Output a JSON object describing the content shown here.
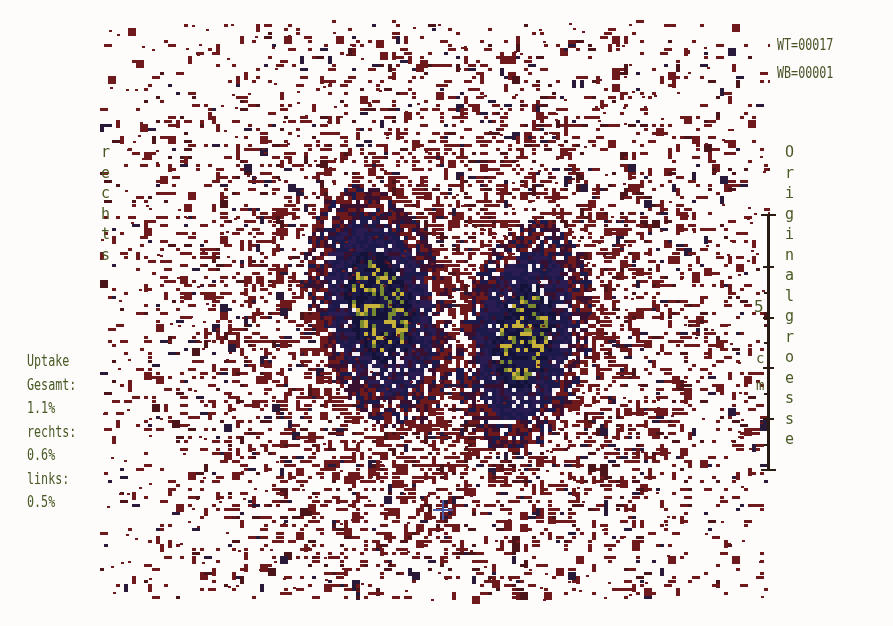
{
  "counters": {
    "wt": "WT=00017",
    "wb": "WB=00001"
  },
  "side_label": {
    "text": "rechts",
    "chars": [
      "r",
      "e",
      "c",
      "h",
      "t",
      "s"
    ]
  },
  "uptake": {
    "title": "Uptake",
    "total_label": "Gesamt:",
    "total_value": "1.1%",
    "right_label": "rechts:",
    "right_value": "0.6%",
    "left_label": "links:",
    "left_value": "0.5%"
  },
  "size_label": {
    "text": "Originalgroesse",
    "chars": [
      "O",
      "r",
      "i",
      "g",
      "i",
      "n",
      "a",
      "l",
      "g",
      "r",
      "o",
      "e",
      "s",
      "s",
      "e"
    ]
  },
  "scale_bar": {
    "value": "5",
    "unit_c": "c",
    "unit_m": "m",
    "unit": "cm",
    "major_ticks": 6
  },
  "colors": {
    "background": "#fdfcfb",
    "scatter_low": "#6e1a1c",
    "scatter_mid": "#3a1030",
    "lobe_core": "#1c1a4a",
    "hotspot": "#c9b23a",
    "text": "#4a5a24",
    "marker_cross": "#4a5aa8",
    "scale_bar": "#2a1a14"
  },
  "image": {
    "type": "thyroid scintigram",
    "lobes": [
      {
        "name": "right-lobe-viewer-left",
        "cx": 378,
        "cy": 305,
        "rx": 62,
        "ry": 112,
        "tilt": -0.25,
        "hotspot": true
      },
      {
        "name": "left-lobe-viewer-right",
        "cx": 522,
        "cy": 335,
        "rx": 58,
        "ry": 105,
        "tilt": 0.18,
        "hotspot": true
      }
    ],
    "marker": {
      "x": 443,
      "y": 510
    }
  }
}
